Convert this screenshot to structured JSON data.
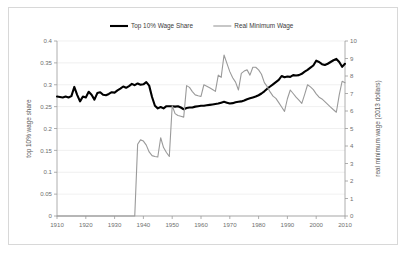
{
  "figure": {
    "background_color": "#ffffff",
    "border_color": "#d8d8d8"
  },
  "legend": {
    "position": "top-center",
    "entries": [
      {
        "label": "Top 10% Wage Share",
        "color": "#000000",
        "width": 2.1
      },
      {
        "label": "Real Minimum Wage",
        "color": "#9a9a9a",
        "width": 1.1
      }
    ]
  },
  "axes": {
    "x": {
      "label": "",
      "min": 1910,
      "max": 2010,
      "ticks": [
        1910,
        1920,
        1930,
        1940,
        1950,
        1960,
        1970,
        1980,
        1990,
        2000,
        2010
      ],
      "tick_labels": [
        "1910",
        "1920",
        "1930",
        "1940",
        "1950",
        "1960",
        "1970",
        "1980",
        "1990",
        "2000",
        "2010"
      ]
    },
    "y_left": {
      "label": "top 10% wage share",
      "min": 0,
      "max": 0.4,
      "ticks": [
        0,
        0.05,
        0.1,
        0.15,
        0.2,
        0.25,
        0.3,
        0.35,
        0.4
      ],
      "tick_labels": [
        "0",
        "0.05",
        "0.1",
        "0.15",
        "0.2",
        "0.25",
        "0.3",
        "0.35",
        "0.4"
      ]
    },
    "y_right": {
      "label": "real minimum wage (2013 dollars)",
      "min": 0,
      "max": 10,
      "ticks": [
        0,
        1,
        2,
        3,
        4,
        5,
        6,
        7,
        8,
        9,
        10
      ],
      "tick_labels": [
        "0",
        "1",
        "2",
        "3",
        "4",
        "5",
        "6",
        "7",
        "8",
        "9",
        "10"
      ]
    }
  },
  "chart_data": {
    "type": "line",
    "title": "",
    "xlabel": "",
    "ylabel": "top 10% wage share",
    "ylabel_secondary": "real minimum wage (2013 dollars)",
    "xlim": [
      1910,
      2010
    ],
    "ylim": [
      0,
      0.4
    ],
    "ylim_secondary": [
      0,
      10
    ],
    "grid": true,
    "legend_position": "top-center",
    "x": [
      1910,
      1911,
      1912,
      1913,
      1914,
      1915,
      1916,
      1917,
      1918,
      1919,
      1920,
      1921,
      1922,
      1923,
      1924,
      1925,
      1926,
      1927,
      1928,
      1929,
      1930,
      1931,
      1932,
      1933,
      1934,
      1935,
      1936,
      1937,
      1938,
      1939,
      1940,
      1941,
      1942,
      1943,
      1944,
      1945,
      1946,
      1947,
      1948,
      1949,
      1950,
      1951,
      1952,
      1953,
      1954,
      1955,
      1956,
      1957,
      1958,
      1959,
      1960,
      1961,
      1962,
      1963,
      1964,
      1965,
      1966,
      1967,
      1968,
      1969,
      1970,
      1971,
      1972,
      1973,
      1974,
      1975,
      1976,
      1977,
      1978,
      1979,
      1980,
      1981,
      1982,
      1983,
      1984,
      1985,
      1986,
      1987,
      1988,
      1989,
      1990,
      1991,
      1992,
      1993,
      1994,
      1995,
      1996,
      1997,
      1998,
      1999,
      2000,
      2001,
      2002,
      2003,
      2004,
      2005,
      2006,
      2007,
      2008,
      2009,
      2010
    ],
    "series": [
      {
        "name": "Top 10% Wage Share",
        "axis": "left",
        "color": "#000000",
        "values": [
          0.273,
          0.272,
          0.271,
          0.273,
          0.271,
          0.274,
          0.295,
          0.277,
          0.262,
          0.273,
          0.271,
          0.284,
          0.277,
          0.266,
          0.281,
          0.283,
          0.277,
          0.276,
          0.279,
          0.283,
          0.282,
          0.287,
          0.291,
          0.296,
          0.293,
          0.297,
          0.302,
          0.299,
          0.303,
          0.3,
          0.301,
          0.306,
          0.298,
          0.272,
          0.252,
          0.246,
          0.249,
          0.246,
          0.251,
          0.251,
          0.251,
          0.25,
          0.251,
          0.248,
          0.244,
          0.247,
          0.248,
          0.248,
          0.25,
          0.251,
          0.252,
          0.252,
          0.253,
          0.254,
          0.255,
          0.256,
          0.257,
          0.259,
          0.261,
          0.259,
          0.257,
          0.258,
          0.26,
          0.261,
          0.262,
          0.264,
          0.267,
          0.269,
          0.271,
          0.273,
          0.276,
          0.28,
          0.285,
          0.291,
          0.296,
          0.301,
          0.306,
          0.311,
          0.32,
          0.317,
          0.319,
          0.318,
          0.322,
          0.321,
          0.322,
          0.325,
          0.33,
          0.334,
          0.339,
          0.344,
          0.355,
          0.352,
          0.347,
          0.345,
          0.348,
          0.352,
          0.356,
          0.359,
          0.352,
          0.341,
          0.348
        ]
      },
      {
        "name": "Real Minimum Wage",
        "axis": "right",
        "color": "#9a9a9a",
        "values": [
          0,
          0,
          0,
          0,
          0,
          0,
          0,
          0,
          0,
          0,
          0,
          0,
          0,
          0,
          0,
          0,
          0,
          0,
          0,
          0,
          0,
          0,
          0,
          0,
          0,
          0,
          0,
          0,
          4.1,
          4.35,
          4.28,
          4.05,
          3.66,
          3.45,
          3.4,
          3.37,
          4.47,
          3.91,
          3.63,
          3.4,
          6.3,
          5.85,
          5.74,
          5.7,
          5.65,
          7.45,
          7.35,
          7.11,
          6.92,
          6.87,
          6.83,
          7.5,
          7.42,
          7.33,
          7.23,
          7.12,
          8.05,
          7.92,
          9.2,
          8.72,
          8.25,
          7.9,
          7.65,
          7.2,
          8.15,
          8.28,
          8.35,
          8.05,
          8.5,
          8.5,
          8.35,
          8.1,
          7.62,
          7.39,
          7.09,
          6.85,
          6.72,
          6.48,
          6.23,
          5.98,
          6.7,
          7.2,
          7.0,
          6.79,
          6.62,
          6.44,
          6.95,
          7.5,
          7.38,
          7.22,
          6.98,
          6.79,
          6.69,
          6.54,
          6.38,
          6.22,
          6.07,
          5.93,
          6.92,
          7.7,
          7.62
        ]
      }
    ]
  }
}
